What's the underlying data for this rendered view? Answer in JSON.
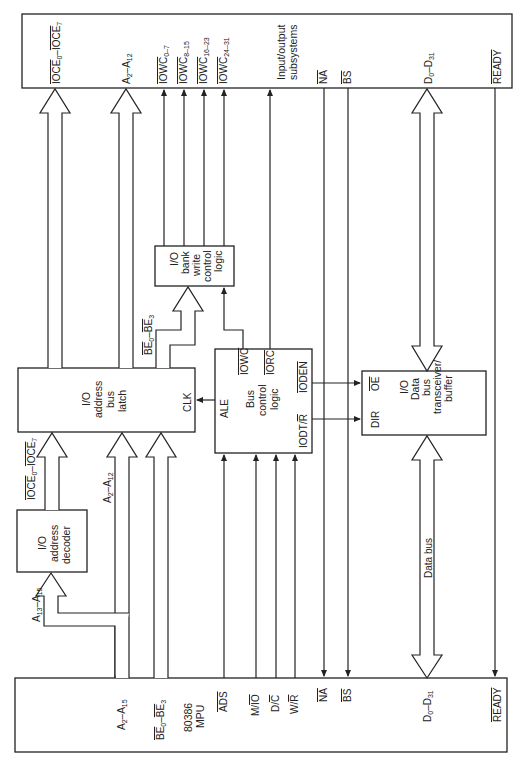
{
  "blocks": {
    "io_subsystems": {
      "label_lines": [
        "Input/output",
        "subsystems"
      ]
    },
    "mpu": {
      "label_lines": [
        "80386",
        "MPU"
      ]
    },
    "address_decoder": {
      "label_lines": [
        "I/O",
        "address",
        "decoder"
      ]
    },
    "address_latch": {
      "label_lines": [
        "I/O",
        "address",
        "bus",
        "latch"
      ],
      "pin_clk": "CLK"
    },
    "bank_write_logic": {
      "label_lines": [
        "I/O",
        "bank",
        "write",
        "control",
        "logic"
      ]
    },
    "bus_control_logic": {
      "label_lines": [
        "Bus",
        "control",
        "logic"
      ],
      "pin_ale": "ALE",
      "pin_iowc": "IOWC",
      "pin_iorc": "IORC",
      "pin_ioden": "IODEN",
      "pin_iodt": "IODT/",
      "pin_iodt_r": "R"
    },
    "data_transceiver": {
      "label_lines": [
        "I/O",
        "Data",
        "bus",
        "transceiver/",
        "buffer"
      ],
      "pin_oe": "OE",
      "pin_dir": "DIR"
    }
  },
  "top_signals": {
    "ioce": {
      "base": "IOCE",
      "s0": "0",
      "sep": "–",
      "s1": "7"
    },
    "addr": {
      "a": "A",
      "s0": "2",
      "sep": "–A",
      "s1": "12"
    },
    "iowc0": {
      "base": "IOWC",
      "sub": "0–7"
    },
    "iowc1": {
      "base": "IOWC",
      "sub": "8–15"
    },
    "iowc2": {
      "base": "IOWC",
      "sub": "16–23"
    },
    "iowc3": {
      "base": "IOWC",
      "sub": "24–31"
    },
    "na": "NA",
    "bs": "BS",
    "data": {
      "a": "D",
      "s0": "0",
      "sep": "–D",
      "s1": "31"
    },
    "ready": "READY"
  },
  "mid_signals": {
    "ioce": {
      "base": "IOCE",
      "s0": "0",
      "sep": "–",
      "s1": "7"
    },
    "addr": {
      "a": "A",
      "s0": "2",
      "sep": "–A",
      "s1": "12"
    },
    "be": {
      "base": "BE",
      "s0": "0",
      "sep": "–",
      "s1": "3"
    },
    "a13": {
      "a": "A",
      "s0": "13",
      "sep": "–A",
      "s1": "15"
    },
    "data_bus": "Data bus"
  },
  "mpu_signals": {
    "addr": {
      "a": "A",
      "s0": "2",
      "sep": "–A",
      "s1": "15"
    },
    "be": {
      "base": "BE",
      "s0": "0",
      "sep": "–",
      "s1": "3"
    },
    "ads": "ADS",
    "mio_m": "M/",
    "mio_io": "IO",
    "dc_d": "D/",
    "dc_c": "C",
    "wr_w": "W/",
    "wr_r": "R",
    "na": "NA",
    "bs": "BS",
    "data": {
      "a": "D",
      "s0": "0",
      "sep": "–D",
      "s1": "31"
    },
    "ready": "READY"
  }
}
